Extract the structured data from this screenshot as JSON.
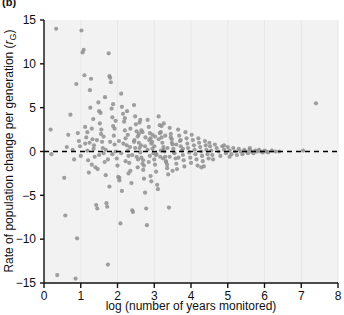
{
  "panel": {
    "label": "(b)"
  },
  "chart_data": {
    "type": "scatter",
    "title": "",
    "subtitle": "",
    "xlabel": "log (number of years monitored)",
    "ylabel": "Rate of population change per generation (rG)",
    "ylabel_main": "Rate of population change per generation (",
    "ylabel_italic": "r",
    "ylabel_subscript": "G",
    "ylabel_close": ")",
    "xlim": [
      0,
      8
    ],
    "ylim": [
      -15,
      15
    ],
    "xticks": [
      0,
      1,
      2,
      3,
      4,
      5,
      6,
      7,
      8
    ],
    "xtick_labels": [
      "0",
      "1",
      "2",
      "3",
      "4",
      "5",
      "6",
      "7",
      "8"
    ],
    "yticks": [
      -15,
      -10,
      -5,
      0,
      5,
      10,
      15
    ],
    "ytick_labels": [
      "-15",
      "-10",
      "-5",
      "0",
      "5",
      "10",
      "15"
    ],
    "grid": "faint-vertical",
    "legend": "none",
    "reference_line": {
      "orientation": "horizontal",
      "y": 0,
      "style": "dashed",
      "color": "#000000",
      "label": ""
    },
    "marker": {
      "shape": "circle",
      "color": "#8f8f8f",
      "size_px": 4.2,
      "opacity": 0.85
    },
    "plot_background": "#f2f2f2",
    "points": [
      [
        0.18,
        2.5
      ],
      [
        0.2,
        -0.3
      ],
      [
        0.33,
        14.0
      ],
      [
        0.36,
        -14.1
      ],
      [
        0.55,
        -3.0
      ],
      [
        0.58,
        -7.3
      ],
      [
        0.62,
        0.5
      ],
      [
        0.66,
        1.9
      ],
      [
        0.72,
        4.2
      ],
      [
        0.78,
        0.2
      ],
      [
        0.82,
        -0.9
      ],
      [
        0.86,
        -14.5
      ],
      [
        0.88,
        7.7
      ],
      [
        0.9,
        -9.9
      ],
      [
        0.92,
        2.1
      ],
      [
        0.95,
        1.2
      ],
      [
        0.98,
        0.6
      ],
      [
        1.0,
        -0.5
      ],
      [
        1.02,
        13.8
      ],
      [
        1.05,
        11.3
      ],
      [
        1.08,
        11.6
      ],
      [
        1.1,
        8.7
      ],
      [
        1.12,
        0.9
      ],
      [
        1.15,
        1.6
      ],
      [
        1.18,
        0.1
      ],
      [
        1.2,
        -1.0
      ],
      [
        1.22,
        -2.4
      ],
      [
        1.25,
        7.0
      ],
      [
        1.28,
        8.3
      ],
      [
        1.3,
        2.6
      ],
      [
        1.32,
        1.4
      ],
      [
        1.35,
        0.3
      ],
      [
        1.38,
        -0.6
      ],
      [
        1.4,
        -1.8
      ],
      [
        1.42,
        -6.1
      ],
      [
        1.45,
        -6.5
      ],
      [
        1.48,
        5.6
      ],
      [
        1.5,
        4.6
      ],
      [
        1.52,
        3.2
      ],
      [
        1.55,
        2.0
      ],
      [
        1.58,
        1.1
      ],
      [
        1.6,
        0.4
      ],
      [
        1.62,
        -0.2
      ],
      [
        1.65,
        -1.2
      ],
      [
        1.68,
        -2.7
      ],
      [
        1.7,
        -5.9
      ],
      [
        1.72,
        -6.3
      ],
      [
        1.74,
        -12.9
      ],
      [
        1.76,
        11.2
      ],
      [
        1.78,
        8.6
      ],
      [
        1.8,
        8.4
      ],
      [
        1.82,
        7.9
      ],
      [
        1.84,
        4.9
      ],
      [
        1.86,
        3.9
      ],
      [
        1.88,
        2.9
      ],
      [
        1.9,
        1.8
      ],
      [
        1.92,
        0.8
      ],
      [
        1.95,
        0.0
      ],
      [
        1.98,
        -0.8
      ],
      [
        2.0,
        -1.6
      ],
      [
        2.02,
        -2.9
      ],
      [
        2.05,
        -3.3
      ],
      [
        2.08,
        -8.2
      ],
      [
        2.1,
        6.6
      ],
      [
        2.12,
        5.1
      ],
      [
        2.15,
        4.3
      ],
      [
        2.18,
        3.4
      ],
      [
        2.2,
        2.4
      ],
      [
        2.22,
        1.5
      ],
      [
        2.25,
        0.7
      ],
      [
        2.28,
        0.1
      ],
      [
        2.3,
        -0.5
      ],
      [
        2.32,
        -1.3
      ],
      [
        2.35,
        -2.2
      ],
      [
        2.38,
        -3.6
      ],
      [
        2.4,
        -6.7
      ],
      [
        2.42,
        -6.9
      ],
      [
        2.45,
        5.3
      ],
      [
        2.48,
        4.0
      ],
      [
        2.5,
        3.1
      ],
      [
        2.52,
        2.3
      ],
      [
        2.55,
        1.7
      ],
      [
        2.58,
        1.0
      ],
      [
        2.6,
        0.4
      ],
      [
        2.62,
        -0.1
      ],
      [
        2.65,
        -0.7
      ],
      [
        2.68,
        -1.4
      ],
      [
        2.7,
        -2.1
      ],
      [
        2.72,
        -3.1
      ],
      [
        2.75,
        -4.7
      ],
      [
        2.78,
        -6.5
      ],
      [
        2.8,
        -8.4
      ],
      [
        2.82,
        3.6
      ],
      [
        2.85,
        2.8
      ],
      [
        2.88,
        2.1
      ],
      [
        2.9,
        1.5
      ],
      [
        2.92,
        0.9
      ],
      [
        2.95,
        0.3
      ],
      [
        2.98,
        -0.2
      ],
      [
        3.0,
        -0.9
      ],
      [
        3.02,
        -1.5
      ],
      [
        3.05,
        -2.3
      ],
      [
        3.08,
        -3.8
      ],
      [
        3.1,
        -4.3
      ],
      [
        3.12,
        4.0
      ],
      [
        3.15,
        3.0
      ],
      [
        3.18,
        2.2
      ],
      [
        3.2,
        1.6
      ],
      [
        3.22,
        1.0
      ],
      [
        3.25,
        0.5
      ],
      [
        3.28,
        0.0
      ],
      [
        3.3,
        -0.6
      ],
      [
        3.32,
        -1.2
      ],
      [
        3.35,
        -1.9
      ],
      [
        3.38,
        -2.6
      ],
      [
        3.4,
        -6.4
      ],
      [
        3.42,
        2.7
      ],
      [
        3.45,
        2.0
      ],
      [
        3.48,
        1.4
      ],
      [
        3.5,
        0.8
      ],
      [
        3.52,
        0.3
      ],
      [
        3.55,
        -0.2
      ],
      [
        3.58,
        -0.8
      ],
      [
        3.6,
        -1.4
      ],
      [
        3.62,
        -2.0
      ],
      [
        3.65,
        2.5
      ],
      [
        3.68,
        1.8
      ],
      [
        3.7,
        1.2
      ],
      [
        3.72,
        0.6
      ],
      [
        3.75,
        0.1
      ],
      [
        3.78,
        -0.4
      ],
      [
        3.8,
        -1.0
      ],
      [
        3.82,
        -1.7
      ],
      [
        3.85,
        2.2
      ],
      [
        3.88,
        1.5
      ],
      [
        3.9,
        0.9
      ],
      [
        3.92,
        0.4
      ],
      [
        3.95,
        -0.1
      ],
      [
        3.98,
        -0.7
      ],
      [
        4.0,
        -1.3
      ],
      [
        4.02,
        1.9
      ],
      [
        4.05,
        1.3
      ],
      [
        4.08,
        0.7
      ],
      [
        4.1,
        0.2
      ],
      [
        4.12,
        -0.3
      ],
      [
        4.15,
        -0.9
      ],
      [
        4.18,
        -1.6
      ],
      [
        4.2,
        1.5
      ],
      [
        4.22,
        1.0
      ],
      [
        4.25,
        0.5
      ],
      [
        4.28,
        0.0
      ],
      [
        4.3,
        -0.5
      ],
      [
        4.32,
        -1.1
      ],
      [
        4.35,
        -1.7
      ],
      [
        4.38,
        1.2
      ],
      [
        4.4,
        0.7
      ],
      [
        4.42,
        0.2
      ],
      [
        4.45,
        -0.3
      ],
      [
        4.48,
        -0.8
      ],
      [
        4.5,
        1.0
      ],
      [
        4.52,
        0.6
      ],
      [
        4.55,
        0.1
      ],
      [
        4.58,
        -0.4
      ],
      [
        4.6,
        -0.9
      ],
      [
        4.65,
        0.8
      ],
      [
        4.7,
        0.4
      ],
      [
        4.75,
        0.0
      ],
      [
        4.8,
        -0.5
      ],
      [
        4.85,
        0.6
      ],
      [
        4.9,
        0.2
      ],
      [
        4.95,
        -0.2
      ],
      [
        5.0,
        0.5
      ],
      [
        5.05,
        0.1
      ],
      [
        5.1,
        -0.3
      ],
      [
        5.15,
        0.4
      ],
      [
        5.2,
        0.0
      ],
      [
        5.25,
        -0.4
      ],
      [
        5.3,
        0.3
      ],
      [
        5.35,
        0.0
      ],
      [
        5.4,
        -0.3
      ],
      [
        5.45,
        0.2
      ],
      [
        5.5,
        0.0
      ],
      [
        5.55,
        -0.2
      ],
      [
        5.6,
        0.2
      ],
      [
        5.65,
        0.0
      ],
      [
        5.7,
        -0.2
      ],
      [
        5.75,
        0.1
      ],
      [
        5.8,
        0.0
      ],
      [
        5.85,
        0.2
      ],
      [
        5.9,
        0.0
      ],
      [
        5.95,
        -0.1
      ],
      [
        6.0,
        0.1
      ],
      [
        6.05,
        0.0
      ],
      [
        6.1,
        -0.1
      ],
      [
        6.2,
        0.1
      ],
      [
        6.3,
        0.0
      ],
      [
        6.4,
        0.0
      ],
      [
        7.05,
        0.1
      ],
      [
        7.4,
        5.5
      ],
      [
        1.12,
        2.8
      ],
      [
        1.18,
        2.2
      ],
      [
        1.24,
        1.0
      ],
      [
        1.3,
        -1.5
      ],
      [
        1.36,
        0.7
      ],
      [
        1.44,
        1.3
      ],
      [
        1.5,
        -0.4
      ],
      [
        1.56,
        2.5
      ],
      [
        1.62,
        1.7
      ],
      [
        1.68,
        0.2
      ],
      [
        1.74,
        -0.9
      ],
      [
        1.8,
        1.1
      ],
      [
        1.86,
        -0.3
      ],
      [
        1.92,
        2.6
      ],
      [
        2.04,
        1.2
      ],
      [
        2.1,
        -0.2
      ],
      [
        2.16,
        0.9
      ],
      [
        2.22,
        -1.1
      ],
      [
        2.28,
        1.9
      ],
      [
        2.34,
        0.5
      ],
      [
        2.4,
        -0.4
      ],
      [
        2.46,
        1.3
      ],
      [
        2.52,
        -0.6
      ],
      [
        2.58,
        2.0
      ],
      [
        2.64,
        0.7
      ],
      [
        2.7,
        -1.0
      ],
      [
        2.76,
        1.6
      ],
      [
        2.82,
        0.2
      ],
      [
        2.88,
        -0.5
      ],
      [
        2.94,
        1.1
      ],
      [
        3.0,
        0.6
      ],
      [
        3.06,
        -0.3
      ],
      [
        3.12,
        1.4
      ],
      [
        3.18,
        0.1
      ],
      [
        3.24,
        -0.8
      ],
      [
        3.3,
        1.8
      ],
      [
        3.36,
        0.4
      ],
      [
        3.42,
        -0.6
      ],
      [
        3.48,
        1.0
      ],
      [
        3.54,
        -0.1
      ],
      [
        3.6,
        0.8
      ],
      [
        3.66,
        -0.7
      ],
      [
        3.72,
        1.3
      ],
      [
        3.78,
        0.3
      ],
      [
        2.35,
        2.6
      ],
      [
        2.45,
        1.1
      ],
      [
        2.55,
        -1.8
      ],
      [
        2.65,
        2.4
      ],
      [
        2.75,
        0.6
      ],
      [
        2.85,
        -1.2
      ],
      [
        2.95,
        1.9
      ],
      [
        3.05,
        -0.4
      ],
      [
        3.15,
        2.1
      ],
      [
        3.25,
        0.2
      ],
      [
        3.35,
        -1.5
      ],
      [
        3.45,
        1.6
      ],
      [
        2.2,
        3.8
      ],
      [
        2.3,
        -2.5
      ],
      [
        2.6,
        3.3
      ],
      [
        2.9,
        -2.8
      ],
      [
        3.2,
        2.9
      ],
      [
        3.5,
        -2.2
      ],
      [
        1.95,
        3.5
      ],
      [
        2.05,
        -3.0
      ],
      [
        4.28,
        -1.8
      ],
      [
        4.9,
        0.7
      ],
      [
        5.05,
        -0.6
      ],
      [
        5.6,
        0.4
      ],
      [
        2.68,
        2.2
      ],
      [
        2.72,
        -1.6
      ],
      [
        3.02,
        1.7
      ],
      [
        3.32,
        -1.1
      ],
      [
        2.48,
        0.4
      ],
      [
        2.56,
        -0.9
      ],
      [
        2.86,
        1.3
      ],
      [
        3.16,
        -0.6
      ],
      [
        1.26,
        5.0
      ],
      [
        1.34,
        3.7
      ],
      [
        1.46,
        -2.0
      ],
      [
        1.54,
        4.4
      ],
      [
        1.66,
        6.2
      ],
      [
        1.78,
        -4.0
      ],
      [
        1.88,
        5.4
      ],
      [
        2.12,
        -4.5
      ],
      [
        2.26,
        4.6
      ],
      [
        2.62,
        3.6
      ],
      [
        2.92,
        -3.4
      ],
      [
        3.26,
        3.2
      ]
    ]
  }
}
